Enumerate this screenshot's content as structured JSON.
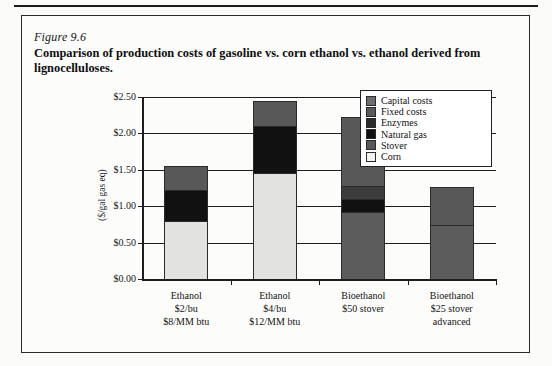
{
  "figure": {
    "number": "Figure 9.6",
    "caption": "Comparison of production costs of gasoline vs. corn ethanol vs. ethanol derived from lignocelluloses."
  },
  "chart_data": {
    "type": "bar",
    "subtype": "stacked-bar",
    "title": "Comparison of production costs of gasoline vs. corn ethanol vs. ethanol derived from lignocelluloses.",
    "xlabel": "",
    "ylabel": "($/gal gas eq)",
    "ylim": [
      0.0,
      2.5
    ],
    "ytick_labels": [
      "$2.50",
      "$2.00",
      "$1.50",
      "$1.00",
      "$0.50",
      "$0.00"
    ],
    "ytick_values": [
      2.5,
      2.0,
      1.5,
      1.0,
      0.5,
      0.0
    ],
    "grid": true,
    "legend_position": "top-right",
    "categories": [
      "Ethanol\n$2/bu\n$8/MM btu",
      "Ethanol\n$4/bu\n$12/MM btu",
      "Bioethanol\n$50 stover",
      "Bioethanol\n$25 stover\nadvanced"
    ],
    "category_lines": [
      [
        "Ethanol",
        "$2/bu",
        "$8/MM btu"
      ],
      [
        "Ethanol",
        "$4/bu",
        "$12/MM btu"
      ],
      [
        "Bioethanol",
        "$50 stover"
      ],
      [
        "Bioethanol",
        "$25 stover",
        "advanced"
      ]
    ],
    "series": [
      {
        "name": "Corn",
        "color": "#e2e2e0",
        "values": [
          0.8,
          1.45,
          0.0,
          0.0
        ]
      },
      {
        "name": "Stover",
        "color": "#5c5c5c",
        "values": [
          0.0,
          0.0,
          0.92,
          0.74
        ]
      },
      {
        "name": "Natural gas",
        "color": "#111111",
        "values": [
          0.42,
          0.65,
          0.18,
          0.0
        ]
      },
      {
        "name": "Enzymes",
        "color": "#3c3c3c",
        "values": [
          0.0,
          0.0,
          0.18,
          0.0
        ]
      },
      {
        "name": "Fixed costs",
        "color": "#585858",
        "values": [
          0.33,
          0.35,
          0.94,
          0.53
        ]
      },
      {
        "name": "Capital costs",
        "color": "#6e6e6e",
        "values": [
          0.0,
          0.0,
          0.0,
          0.0
        ]
      }
    ],
    "totals": [
      1.55,
      2.45,
      2.22,
      1.27
    ]
  },
  "legend": {
    "items": [
      {
        "label": "Capital costs",
        "color": "#6e6e6e"
      },
      {
        "label": "Fixed costs",
        "color": "#5a5a5a"
      },
      {
        "label": "Enzymes",
        "color": "#2b2b2b"
      },
      {
        "label": "Natural gas",
        "color": "#111111"
      },
      {
        "label": "Stover",
        "color": "#585858"
      },
      {
        "label": "Corn",
        "color": "#f2f2f0"
      }
    ]
  },
  "axis": {
    "y_title": "($/gal gas eq)"
  }
}
